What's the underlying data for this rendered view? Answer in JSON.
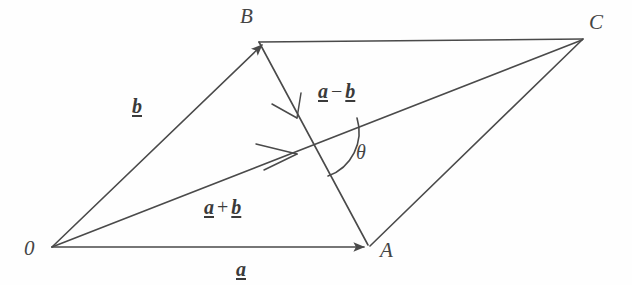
{
  "figure": {
    "background_color": "#fefefe",
    "stroke_color": "#4a4a4a",
    "stroke_width": 1.6,
    "points": {
      "O": {
        "label": "0",
        "x": 52,
        "y": 247,
        "label_x": 26,
        "label_y": 250
      },
      "A": {
        "label": "A",
        "x": 368,
        "y": 247,
        "label_x": 381,
        "label_y": 249
      },
      "B": {
        "label": "B",
        "x": 259,
        "y": 42,
        "label_x": 242,
        "label_y": 10
      },
      "C": {
        "label": "C",
        "x": 583,
        "y": 39,
        "label_x": 590,
        "label_y": 15
      }
    },
    "edges": [
      {
        "name": "vector-a",
        "from": "O",
        "to": "A",
        "arrow": "filled"
      },
      {
        "name": "vector-b",
        "from": "O",
        "to": "B",
        "arrow": "filled"
      },
      {
        "name": "side-bc",
        "from": "B",
        "to": "C",
        "arrow": "none"
      },
      {
        "name": "side-ac",
        "from": "A",
        "to": "C",
        "arrow": "none"
      },
      {
        "name": "vector-a-plus-b",
        "from": "O",
        "to": "C",
        "arrow": "mid-open"
      },
      {
        "name": "vector-a-minus-b",
        "from": "B",
        "to": "A",
        "arrow": "mid-open"
      }
    ],
    "labels": {
      "vector_a": {
        "text": "a",
        "x": 236,
        "y": 261
      },
      "vector_b": {
        "text": "b",
        "x": 132,
        "y": 96
      },
      "vector_sum": {
        "base": "a",
        "operator": "+",
        "addend": "b",
        "x": 204,
        "y": 198
      },
      "vector_difference": {
        "base": "a",
        "operator": "−",
        "addend": "b",
        "x": 318,
        "y": 82
      },
      "angle": {
        "text": "θ",
        "x": 356,
        "y": 143
      }
    },
    "angle_arc": {
      "name": "theta-arc",
      "vertex_x": 314,
      "vertex_y": 131,
      "radius": 46,
      "start_deg": 15,
      "end_deg": 72
    }
  }
}
